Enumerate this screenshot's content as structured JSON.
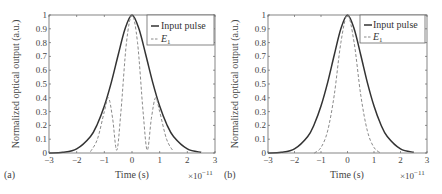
{
  "chart_data": [
    {
      "panel": "(a)",
      "type": "line",
      "xlabel": "Time (s)",
      "ylabel": "Normalized optical output (a.u.)",
      "x_multiplier": "×10−11",
      "xlim": [
        -3,
        3
      ],
      "ylim": [
        0,
        1
      ],
      "xticks": [
        "−3",
        "−2",
        "−1",
        "0",
        "1",
        "2",
        "3"
      ],
      "yticks": [
        "0",
        "0.1",
        "0.2",
        "0.3",
        "0.4",
        "0.5",
        "0.6",
        "0.7",
        "0.8",
        "0.9",
        "1"
      ],
      "legend": [
        "Input pulse",
        "E1"
      ],
      "legend_position": "upper right",
      "grid": false,
      "series": [
        {
          "name": "Input pulse",
          "style": "solid",
          "x": [
            -3,
            -2.5,
            -2,
            -1.5,
            -1.25,
            -1,
            -0.75,
            -0.5,
            -0.25,
            0,
            0.25,
            0.5,
            0.75,
            1,
            1.25,
            1.5,
            2,
            2.5
          ],
          "values": [
            0.0,
            0.005,
            0.03,
            0.12,
            0.21,
            0.34,
            0.51,
            0.71,
            0.9,
            1.0,
            0.9,
            0.71,
            0.51,
            0.34,
            0.21,
            0.12,
            0.03,
            0.005
          ]
        },
        {
          "name": "E1",
          "style": "dashed",
          "x": [
            -1.5,
            -1.25,
            -1.0,
            -0.85,
            -0.7,
            -0.55,
            -0.4,
            -0.2,
            0,
            0.2,
            0.4,
            0.55,
            0.7,
            0.85,
            1.0,
            1.25,
            1.5
          ],
          "values": [
            0.01,
            0.1,
            0.3,
            0.4,
            0.25,
            0.02,
            0.3,
            0.8,
            1.0,
            0.8,
            0.3,
            0.02,
            0.25,
            0.4,
            0.3,
            0.1,
            0.01
          ]
        }
      ]
    },
    {
      "panel": "(b)",
      "type": "line",
      "xlabel": "Time (s)",
      "ylabel": "Normalized optical output (a.u.)",
      "x_multiplier": "×10−11",
      "xlim": [
        -3,
        3
      ],
      "ylim": [
        0,
        1
      ],
      "xticks": [
        "−3",
        "−2",
        "−1",
        "0",
        "1",
        "2",
        "3"
      ],
      "yticks": [
        "0",
        "0.1",
        "0.2",
        "0.3",
        "0.4",
        "0.5",
        "0.6",
        "0.7",
        "0.8",
        "0.9",
        "1"
      ],
      "legend": [
        "Input pulse",
        "E1"
      ],
      "legend_position": "upper right",
      "grid": false,
      "series": [
        {
          "name": "Input pulse",
          "style": "solid",
          "x": [
            -3,
            -2.5,
            -2,
            -1.5,
            -1.25,
            -1,
            -0.75,
            -0.5,
            -0.25,
            0,
            0.25,
            0.5,
            0.75,
            1,
            1.25,
            1.5,
            2,
            2.5
          ],
          "values": [
            0.0,
            0.005,
            0.03,
            0.12,
            0.21,
            0.34,
            0.51,
            0.71,
            0.9,
            1.0,
            0.9,
            0.71,
            0.51,
            0.34,
            0.21,
            0.12,
            0.03,
            0.005
          ]
        },
        {
          "name": "E1",
          "style": "dashed",
          "x": [
            -1.25,
            -1,
            -0.75,
            -0.5,
            -0.25,
            0,
            0.25,
            0.5,
            0.75,
            1,
            1.25
          ],
          "values": [
            0.0,
            0.04,
            0.16,
            0.42,
            0.8,
            1.0,
            0.8,
            0.42,
            0.16,
            0.04,
            0.0
          ]
        }
      ]
    }
  ],
  "panels": [
    {
      "label": "(a)",
      "xlabel": "Time (s)",
      "ylabel": "Normalized optical output (a.u.)",
      "multiplier_base": "×10",
      "multiplier_exp": "−11",
      "legend": {
        "item1": "Input pulse",
        "item2_base": "E",
        "item2_sub": "1"
      }
    },
    {
      "label": "(b)",
      "xlabel": "Time (s)",
      "ylabel": "Normalized optical output (a.u.)",
      "multiplier_base": "×10",
      "multiplier_exp": "−11",
      "legend": {
        "item1": "Input pulse",
        "item2_base": "E",
        "item2_sub": "1"
      }
    }
  ],
  "colors": {
    "input": "#333333",
    "e1": "#8a8a8a",
    "axis": "#555555"
  }
}
